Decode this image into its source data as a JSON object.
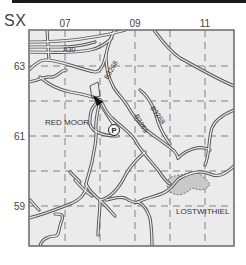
{
  "map": {
    "grid_square": "SX",
    "columns": [
      {
        "label": "07",
        "x": 65
      },
      {
        "label": "09",
        "x": 135
      },
      {
        "label": "11",
        "x": 205
      }
    ],
    "rows": [
      {
        "label": "63",
        "y": 66
      },
      {
        "label": "61",
        "y": 136
      },
      {
        "label": "59",
        "y": 206
      }
    ],
    "places": [
      {
        "name": "RED MOOR"
      },
      {
        "name": "LOSTWITHIEL"
      }
    ],
    "roads": [
      {
        "name": "A30"
      },
      {
        "name": "B3268"
      },
      {
        "name": "B3268"
      },
      {
        "name": "B3269"
      }
    ],
    "parking": {
      "symbol": "P"
    },
    "colors": {
      "background": "#ebebeb",
      "frame": "#777777",
      "road": "#555555",
      "grid": "#666666",
      "town_fill": "#c9c9c9"
    }
  }
}
